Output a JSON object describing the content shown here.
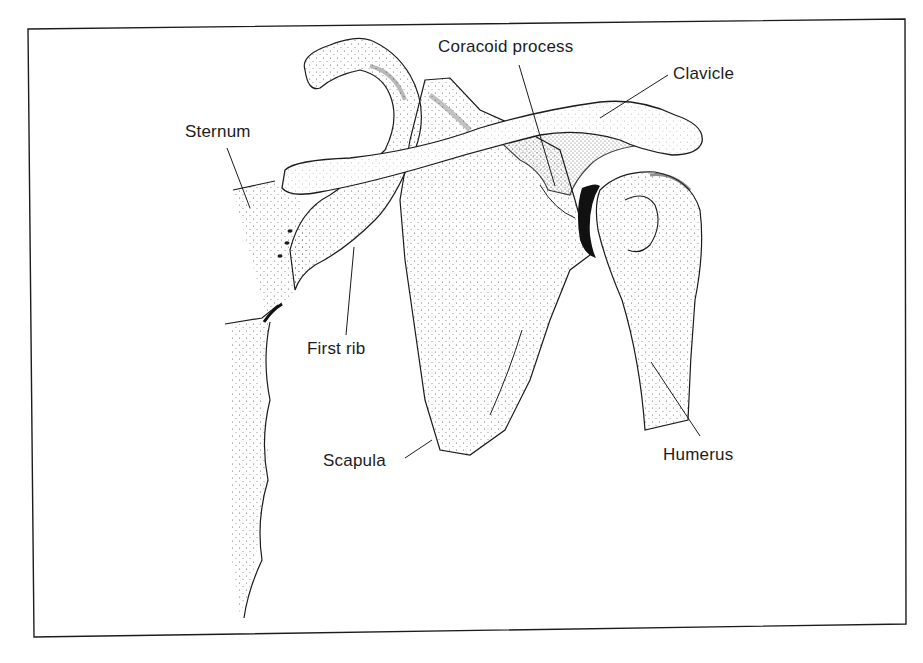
{
  "figure": {
    "colors": {
      "ink": "#1c1c1c",
      "background": "#ffffff",
      "stipple": "#555555"
    },
    "labels": [
      {
        "id": "sternum",
        "text": "Sternum",
        "x": 185,
        "y": 122
      },
      {
        "id": "coracoid",
        "text": "Coracoid process",
        "x": 438,
        "y": 37
      },
      {
        "id": "clavicle",
        "text": "Clavicle",
        "x": 673,
        "y": 64
      },
      {
        "id": "first-rib",
        "text": "First rib",
        "x": 307,
        "y": 339
      },
      {
        "id": "scapula",
        "text": "Scapula",
        "x": 323,
        "y": 451
      },
      {
        "id": "humerus",
        "text": "Humerus",
        "x": 663,
        "y": 445
      }
    ]
  }
}
